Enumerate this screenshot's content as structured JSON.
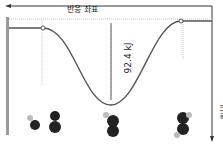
{
  "diagram": {
    "orientation": "rotated-180",
    "x_axis_label": "반응 좌표",
    "y_axis_label": "에너지",
    "energy_gap_label": "92.4 kJ",
    "colors": {
      "curve": "#555555",
      "axis": "#333333",
      "frame": "#9a9a9a",
      "dotted": "#c8c8c8",
      "atom_dark": "#222222",
      "atom_light": "#bbbbbb"
    },
    "states": [
      {
        "name": "reactants",
        "x": 42
      },
      {
        "name": "transition",
        "x": 110
      },
      {
        "name": "products",
        "x": 180
      }
    ]
  }
}
